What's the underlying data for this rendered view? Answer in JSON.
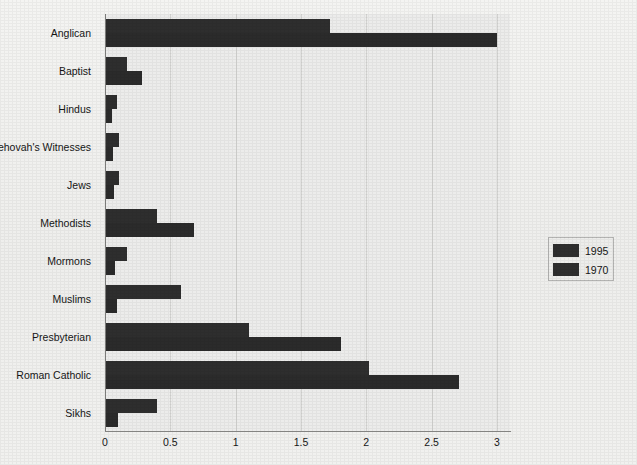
{
  "chart_data": {
    "type": "bar",
    "orientation": "horizontal",
    "title": "",
    "subtitle": "",
    "xlabel": "",
    "ylabel": "",
    "xlim": [
      0,
      3.1
    ],
    "xticks": [
      "0",
      "0.5",
      "1",
      "1.5",
      "2",
      "2.5",
      "3"
    ],
    "xtick_values": [
      0,
      0.5,
      1,
      1.5,
      2,
      2.5,
      3
    ],
    "grid": true,
    "legend_position": "right",
    "categories": [
      "Anglican",
      "Baptist",
      "Hindus",
      "Jehovah's Witnesses",
      "Jews",
      "Methodists",
      "Mormons",
      "Muslims",
      "Presbyterian",
      "Roman Catholic",
      "Sikhs"
    ],
    "series": [
      {
        "name": "1995",
        "color": "#2e2e2e",
        "values": [
          1.72,
          0.17,
          0.09,
          0.11,
          0.11,
          0.4,
          0.17,
          0.58,
          1.1,
          2.02,
          0.4
        ]
      },
      {
        "name": "1970",
        "color": "#2b2b2b",
        "values": [
          3.0,
          0.28,
          0.05,
          0.06,
          0.07,
          0.68,
          0.08,
          0.09,
          1.81,
          2.71,
          0.1
        ]
      }
    ],
    "legend": [
      "1995",
      "1970"
    ]
  },
  "colors": {
    "background": "#f1f1ef",
    "plot_background": "#ececeb",
    "bar": "#2e2e2e",
    "gridline": "#d3d3d1",
    "axis": "#7d7d7b",
    "text": "#161616",
    "legend_border": "#b4b4b2"
  }
}
